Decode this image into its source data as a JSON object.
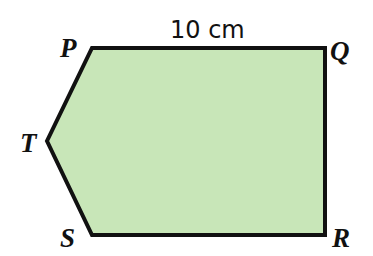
{
  "figure": {
    "shape": "pentagon",
    "fill_color": "#c8e6b8",
    "stroke_color": "#111111",
    "vertices": [
      {
        "name": "P",
        "x": 92,
        "y": 48
      },
      {
        "name": "Q",
        "x": 325,
        "y": 48
      },
      {
        "name": "R",
        "x": 325,
        "y": 235
      },
      {
        "name": "S",
        "x": 92,
        "y": 235
      },
      {
        "name": "T",
        "x": 47,
        "y": 141
      }
    ],
    "labels": {
      "P": "P",
      "Q": "Q",
      "R": "R",
      "S": "S",
      "T": "T"
    },
    "dimension": {
      "side": "PQ",
      "text": "10 cm"
    }
  }
}
